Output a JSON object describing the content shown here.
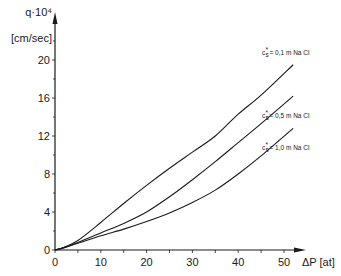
{
  "chart_data": {
    "type": "line",
    "title": "",
    "xlabel": "ΔP [at]",
    "ylabel_line1": "q·10⁴",
    "ylabel_line2": "[cm/sec]",
    "xlim": [
      0,
      55
    ],
    "ylim": [
      0,
      22
    ],
    "grid": false,
    "x_ticks": [
      0,
      10,
      20,
      30,
      40,
      50
    ],
    "y_ticks": [
      0,
      4,
      8,
      12,
      16,
      20
    ],
    "x_tick_labels": [
      "0",
      "10",
      "20",
      "30",
      "40",
      "50"
    ],
    "y_tick_labels": [
      "0",
      "4",
      "8",
      "12",
      "16",
      "20"
    ],
    "series": [
      {
        "name": "c*s = 0,1 m NaCl",
        "label_sub": "s",
        "label_sup": "*",
        "label_text": "= 0,1 m Na Cl",
        "x": [
          0,
          2,
          5,
          10,
          15,
          20,
          25,
          30,
          35,
          40,
          45,
          52
        ],
        "values": [
          0,
          0.3,
          1.0,
          2.9,
          4.9,
          6.8,
          8.6,
          10.3,
          12.0,
          14.3,
          16.3,
          19.5
        ]
      },
      {
        "name": "c*s = 0,5 m NaCl",
        "label_sub": "s",
        "label_sup": "*",
        "label_text": "= 0,5 m Na Cl",
        "x": [
          0,
          2,
          5,
          10,
          15,
          20,
          25,
          30,
          35,
          40,
          45,
          52
        ],
        "values": [
          0,
          0.25,
          0.8,
          1.8,
          2.8,
          4.0,
          5.6,
          7.4,
          9.3,
          11.3,
          13.3,
          16.2
        ]
      },
      {
        "name": "c*s = 1,0 m NaCl",
        "label_sub": "s",
        "label_sup": "*",
        "label_text": "= 1,0 m Na Cl",
        "x": [
          0,
          2,
          5,
          10,
          15,
          20,
          25,
          30,
          35,
          40,
          45,
          52
        ],
        "values": [
          0,
          0.25,
          0.7,
          1.5,
          2.2,
          3.0,
          3.9,
          5.0,
          6.3,
          8.0,
          9.9,
          12.8
        ]
      }
    ],
    "annotations": [
      {
        "series": 0,
        "text": "= 0,1 m Na Cl"
      },
      {
        "series": 1,
        "text": "= 0,5 m Na Cl"
      },
      {
        "series": 2,
        "text": "= 1,0 m Na Cl"
      }
    ]
  }
}
